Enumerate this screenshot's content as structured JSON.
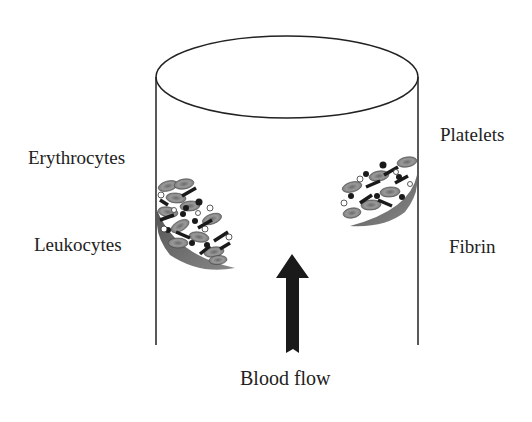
{
  "diagram": {
    "vessel": "cylinder",
    "labels": {
      "erythrocytes": "Erythrocytes",
      "leukocytes": "Leukocytes",
      "platelets": "Platelets",
      "fibrin": "Fibrin",
      "blood_flow": "Blood flow"
    },
    "arrow_direction": "up",
    "colors": {
      "outline": "#222222",
      "erythrocyte": "#8a8a8a",
      "fibrin": "#2a2a2a",
      "platelet_dark": "#1a1a1a",
      "leukocyte": "#ffffff",
      "wall_deposit": "#6e6e6e"
    }
  }
}
